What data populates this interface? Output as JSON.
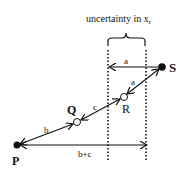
{
  "diagram": {
    "title": "uncertainty in x",
    "title_subscript": "r",
    "points": {
      "S": {
        "label": "S"
      },
      "R": {
        "label": "R"
      },
      "Q": {
        "label": "Q"
      },
      "P": {
        "label": "P"
      }
    },
    "segments": {
      "horizontal_a": "a",
      "diagonal_a": "a",
      "c": "c",
      "b": "b",
      "b_plus_c": "b+c"
    }
  }
}
